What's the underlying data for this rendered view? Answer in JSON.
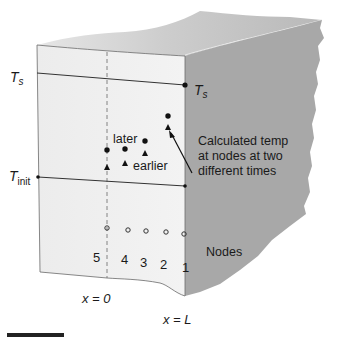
{
  "diagram": {
    "type": "slab-cross-section-finite-difference",
    "labels": {
      "ts_left": "T",
      "ts_left_sub": "s",
      "ts_right": "T",
      "ts_right_sub": "s",
      "tinit": "T",
      "tinit_sub": "init",
      "later": "later",
      "earlier": "earlier",
      "annotation_line1": "Calculated temp",
      "annotation_line2": "at nodes at two",
      "annotation_line3": "different times",
      "nodes": "Nodes",
      "x0": "x = 0",
      "xL": "x = L"
    },
    "node_numbers": [
      "5",
      "4",
      "3",
      "2",
      "1"
    ],
    "later_points_count": 4,
    "earlier_points_count": 4,
    "colors": {
      "front_face": "#ececec",
      "top_face": "#c9c9c9",
      "side_face": "#a6a6a6",
      "line": "#3a3a3a",
      "text": "#1a1a1a"
    }
  }
}
